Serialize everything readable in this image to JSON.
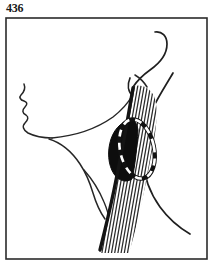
{
  "figure": {
    "number": "436",
    "caption": "",
    "kind": "anatomical-line-illustration"
  },
  "frame": {
    "x": 6,
    "y": 18,
    "width": 201,
    "height": 241,
    "border_color": "#2b2b2b",
    "border_width": 1.6,
    "fill_color": "#ffffff"
  },
  "palette": {
    "ink": "#1a1a1a",
    "outline": "#262626",
    "hatch": "#2b2b2b",
    "mass_fill": "#0d0d0d",
    "paper": "#ffffff",
    "dash_stroke": "#ffffff",
    "dash_shadow": "#111111"
  },
  "elements": {
    "face_profile": {
      "name": "face-profile-outline",
      "path": "M 24 84 C 26 89 24 92 21 95 C 19 97 20 100 24 101 C 27 102 28 104 25 107 C 22 110 22 113 26 115 C 29 117 28 120 25 123 C 22 126 23 130 28 133 C 34 136 42 138 52 138",
      "stroke_width": 1.5
    },
    "jaw_line": {
      "name": "jaw-and-mandible-line",
      "path": "M 52 138 C 74 136 96 129 113 117 C 122 110 128 103 132 96",
      "stroke_width": 1.5
    },
    "neck_anterior": {
      "name": "anterior-neck-contour",
      "path": "M 49 139 C 62 143 72 152 80 164 C 86 173 90 183 93 193 C 96 203 100 212 105 219",
      "stroke_width": 1.5
    },
    "clavicle_line": {
      "name": "clavicle-shoulder-line",
      "path": "M 84 170 C 92 179 99 190 104 202 C 108 211 110 220 112 229",
      "stroke_width": 1.4
    },
    "ear_outer": {
      "name": "ear-helix-curve",
      "path": "M 155 32 C 162 31 167 36 167 44 C 167 54 160 63 150 70 C 143 75 137 81 133 87",
      "stroke_width": 1.7
    },
    "ear_inner": {
      "name": "ear-lobule-curve",
      "path": "M 135 75 C 140 78 144 82 147 87",
      "stroke_width": 1.5
    },
    "mastoid_hook": {
      "name": "mastoid-process-hook",
      "path": "M 130 78 C 127 85 128 92 133 96 C 137 99 143 99 147 95",
      "stroke_width": 1.7
    },
    "trapezius_border": {
      "name": "trapezius-posterior-border",
      "path": "M 173 73 C 166 85 158 97 152 110 C 145 126 142 143 143 160 C 144 177 150 193 160 207 C 168 218 178 227 190 234",
      "stroke_width": 1.7
    },
    "scm_anterior_edge": {
      "name": "scm-anterior-thick-border",
      "path": "M 133 88 C 129 112 122 152 114 190 C 109 214 104 234 100 250",
      "stroke_width": 3.4
    },
    "scm_band": {
      "name": "sternocleidomastoid-muscle-band",
      "clip_path": "M 134 86 C 142 84 150 88 154 96 C 158 106 157 122 154 140 C 150 163 145 188 140 210 C 136 228 132 243 129 253 L 101 253 C 105 232 110 206 115 180 C 121 148 127 114 134 86 Z",
      "hatch_count": 24,
      "hatch_spacing": 3.2,
      "hatch_stroke_width": 1.25
    },
    "lymph_node_mass": {
      "name": "cervical-lymph-node-mass",
      "path": "M 132 120 C 124 120 115 127 111 139 C 107 151 108 165 114 174 C 119 181 126 183 132 179 C 135 167 137 147 138 130 C 137 124 135 120 132 120 Z"
    },
    "dashed_excision_outline": {
      "name": "dashed-excision-outline",
      "cx": 137,
      "cy": 149,
      "rx": 17,
      "ry": 30,
      "rotation": -12,
      "dash_pattern": "7 6",
      "stroke_width": 2.6
    },
    "hatch_top_feather": {
      "name": "muscle-origin-feathering",
      "path": "M 136 84 C 142 82 149 85 153 92"
    }
  }
}
